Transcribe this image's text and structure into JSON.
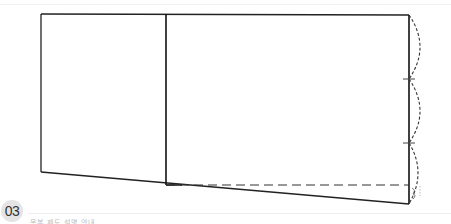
{
  "step": {
    "number": "03"
  },
  "caption": {
    "text": "옷본 제도 설명 안내"
  },
  "diagram": {
    "stroke_color": "#222222",
    "dash_color": "#333333",
    "corner_label": "3"
  }
}
